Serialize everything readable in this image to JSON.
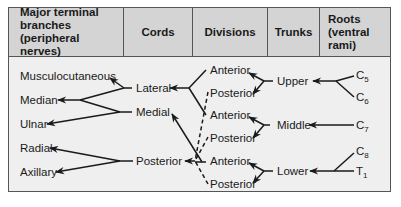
{
  "header": {
    "columns": [
      {
        "label": "Major terminal\nbranches\n(peripheral nerves)"
      },
      {
        "label": "Cords"
      },
      {
        "label": "Divisions"
      },
      {
        "label": "Trunks"
      },
      {
        "label": "Roots\n(ventral\nrami)"
      }
    ]
  },
  "terminal_branches": [
    "Musculocutaneous",
    "Median",
    "Ulnar",
    "Radial",
    "Axillary"
  ],
  "cords": [
    "Lateral",
    "Medial",
    "Posterior"
  ],
  "divisions": [
    "Anterior",
    "Posterior",
    "Anterior",
    "Posterior",
    "Anterior",
    "Posterior"
  ],
  "trunks": [
    "Upper",
    "Middle",
    "Lower"
  ],
  "roots": [
    {
      "base": "C",
      "sub": "5"
    },
    {
      "base": "C",
      "sub": "6"
    },
    {
      "base": "C",
      "sub": "7"
    },
    {
      "base": "C",
      "sub": "8"
    },
    {
      "base": "T",
      "sub": "1"
    }
  ],
  "colors": {
    "header_bg": "#d4d4d4",
    "body_bg": "#efefef",
    "border": "#555555",
    "line": "#1a1a1a"
  }
}
